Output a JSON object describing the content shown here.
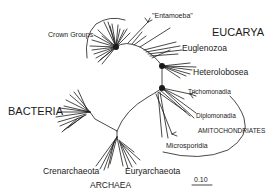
{
  "diagram": {
    "type": "unrooted-phylogenetic-tree",
    "domains": {
      "eucarya": "EUCARYA",
      "bacteria": "BACTERIA",
      "archaea": "ARCHAEA"
    },
    "groups": {
      "crown_groups": "Crown Groups",
      "entamoeba": "\"Entamoeba\"",
      "euglenozoa": "Euglenozoa",
      "heterolobosea": "Heterolobosea",
      "trichomonadia": "Trichomonadia",
      "diplomonadia": "Diplomonadia",
      "amitochondriates": "AMITOCHONDRIATES",
      "microsporidia": "Microsporidia",
      "crenarchaeota": "Crenarchaeota",
      "euryarchaeota": "Euryarchaeota"
    },
    "scale_bar": {
      "label": "0.10"
    },
    "colors": {
      "line": "#1a1a1a",
      "background": "#ffffff"
    }
  }
}
